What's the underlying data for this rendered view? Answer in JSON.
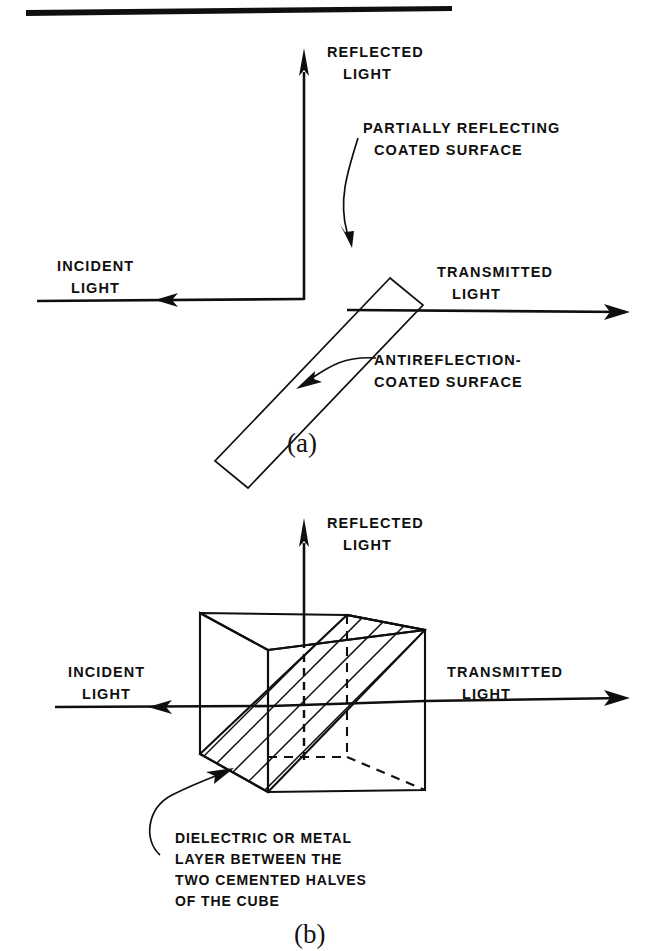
{
  "figure": {
    "title_rule": "top-horizontal-rule",
    "background_color": "#ffffff",
    "ink_color": "#100f0f"
  },
  "panel_a": {
    "panel_label": "(a)",
    "labels": {
      "reflected_light_line1": "REFLECTED",
      "reflected_light_line2": "LIGHT",
      "incident_light_line1": "INCIDENT",
      "incident_light_line2": "LIGHT",
      "transmitted_light_line1": "TRANSMITTED",
      "transmitted_light_line2": "LIGHT",
      "callout_top_line1": "PARTIALLY REFLECTING",
      "callout_top_line2": "COATED SURFACE",
      "callout_bottom_line1": "ANTIREFLECTION-",
      "callout_bottom_line2": "COATED SURFACE"
    },
    "elements": {
      "beamsplitter": "tilted-plate",
      "incident_ray": "horizontal-arrow-right",
      "transmitted_ray": "horizontal-arrow-right",
      "reflected_ray": "vertical-arrow-up"
    }
  },
  "panel_b": {
    "panel_label": "(b)",
    "labels": {
      "reflected_light_line1": "REFLECTED",
      "reflected_light_line2": "LIGHT",
      "incident_light_line1": "INCIDENT",
      "incident_light_line2": "LIGHT",
      "transmitted_light_line1": "TRANSMITTED",
      "transmitted_light_line2": "LIGHT",
      "callout_line1": "DIELECTRIC OR METAL",
      "callout_line2": "LAYER BETWEEN THE",
      "callout_line3": "TWO CEMENTED HALVES",
      "callout_line4": "OF THE CUBE"
    },
    "elements": {
      "cube": "beamsplitter-cube",
      "diagonal_layer": "hatched-diagonal-plane",
      "incident_ray": "horizontal-arrow-right",
      "transmitted_ray": "horizontal-arrow-right",
      "reflected_ray": "vertical-arrow-up-dashed-inside"
    }
  }
}
